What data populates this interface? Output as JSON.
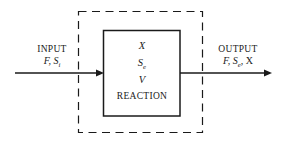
{
  "diagram": {
    "background_color": "#ffffff",
    "line_color": "#1a1a1a",
    "input": {
      "heading": "INPUT",
      "variables_text": "F, S",
      "variables_subscript": "i",
      "arrow_name": "input-flow-arrow"
    },
    "output": {
      "heading": "OUTPUT",
      "variables_prefix": "F, S",
      "variables_subscript": "e",
      "variables_suffix": ", X",
      "arrow_name": "output-flow-arrow"
    },
    "system_boundary": {
      "style": "dashed",
      "name": "system-boundary"
    },
    "reactor": {
      "style": "solid",
      "line_1": "X",
      "line_2_base": "S",
      "line_2_subscript": "e",
      "line_3": "V",
      "line_4": "REACTION"
    }
  }
}
